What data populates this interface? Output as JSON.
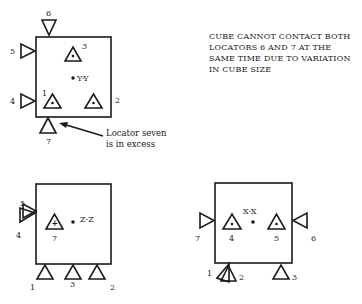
{
  "note": {
    "lines": [
      "CUBE CANNOT CONTACT BOTH",
      "LOCATORS 6 AND 7 AT THE",
      "SAME TIME DUE TO VARIATION",
      "IN CUBE SIZE"
    ]
  },
  "callout": {
    "lines": [
      "Locator seven",
      "is in excess"
    ]
  },
  "views": [
    {
      "axis_label": "Y-Y",
      "locators": [
        "1",
        "2",
        "3",
        "4",
        "5",
        "6",
        "7"
      ]
    },
    {
      "axis_label": "Z-Z",
      "locators": [
        "1",
        "2",
        "3",
        "4",
        "5",
        "7"
      ]
    },
    {
      "axis_label": "X-X",
      "locators": [
        "1",
        "2",
        "3",
        "4",
        "5",
        "6",
        "7"
      ]
    }
  ],
  "colors": {
    "ink": "#1a1a1a",
    "background": "#ffffff"
  }
}
